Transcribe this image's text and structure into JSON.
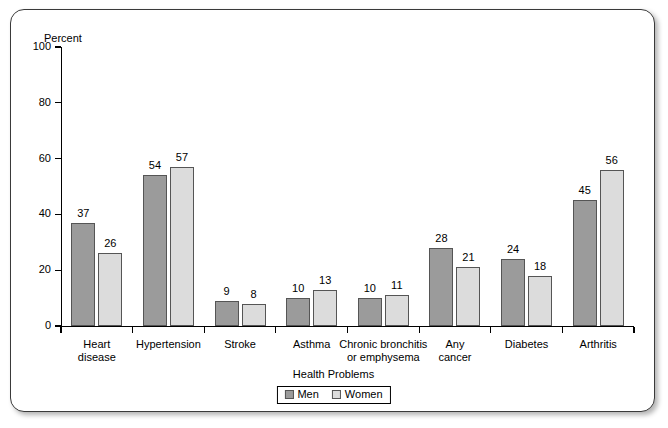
{
  "chart_data": {
    "type": "bar",
    "title": "",
    "xlabel": "Health Problems",
    "ylabel": "Percent",
    "ylim": [
      0,
      100
    ],
    "yticks": [
      0,
      20,
      40,
      60,
      80,
      100
    ],
    "grid": false,
    "legend_position": "bottom",
    "categories": [
      "Heart disease",
      "Hypertension",
      "Stroke",
      "Asthma",
      "Chronic bronchitis or emphysema",
      "Any cancer",
      "Diabetes",
      "Arthritis"
    ],
    "category_lines": [
      [
        "Heart",
        "disease"
      ],
      [
        "Hypertension"
      ],
      [
        "Stroke"
      ],
      [
        "Asthma"
      ],
      [
        "Chronic bronchitis",
        "or emphysema"
      ],
      [
        "Any",
        "cancer"
      ],
      [
        "Diabetes"
      ],
      [
        "Arthritis"
      ]
    ],
    "series": [
      {
        "name": "Men",
        "color": "#9b9b9b",
        "values": [
          37,
          54,
          9,
          10,
          10,
          28,
          24,
          45
        ]
      },
      {
        "name": "Women",
        "color": "#dcdcdc",
        "values": [
          26,
          57,
          8,
          13,
          11,
          21,
          18,
          56
        ]
      }
    ]
  },
  "axes": {
    "y_label": "Percent",
    "y_ticks": [
      "0",
      "20",
      "40",
      "60",
      "80",
      "100"
    ],
    "x_title": "Health Problems"
  },
  "legend": {
    "items": [
      {
        "label": "Men",
        "swatch": "men"
      },
      {
        "label": "Women",
        "swatch": "women"
      }
    ]
  }
}
